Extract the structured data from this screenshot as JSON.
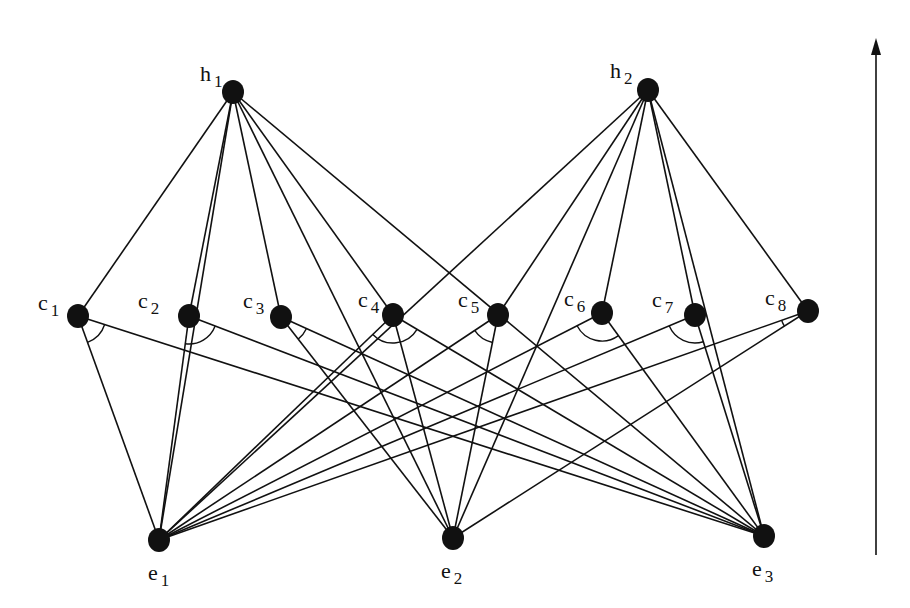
{
  "diagram": {
    "type": "layered-and-or-graph",
    "colors": {
      "ink": "#111111",
      "background": "#ffffff"
    },
    "nodes": [
      {
        "id": "h1",
        "base": "h",
        "sub": "1",
        "x": 233,
        "y": 92,
        "lx": 200,
        "ly": 63
      },
      {
        "id": "h2",
        "base": "h",
        "sub": "2",
        "x": 648,
        "y": 90,
        "lx": 610,
        "ly": 60
      },
      {
        "id": "c1",
        "base": "c",
        "sub": "1",
        "x": 78,
        "y": 316,
        "lx": 38,
        "ly": 292
      },
      {
        "id": "c2",
        "base": "c",
        "sub": "2",
        "x": 189,
        "y": 316,
        "lx": 138,
        "ly": 290
      },
      {
        "id": "c3",
        "base": "c",
        "sub": "3",
        "x": 281,
        "y": 317,
        "lx": 243,
        "ly": 290
      },
      {
        "id": "c4",
        "base": "c",
        "sub": "4",
        "x": 393,
        "y": 315,
        "lx": 358,
        "ly": 289
      },
      {
        "id": "c5",
        "base": "c",
        "sub": "5",
        "x": 498,
        "y": 315,
        "lx": 458,
        "ly": 289
      },
      {
        "id": "c6",
        "base": "c",
        "sub": "6",
        "x": 602,
        "y": 313,
        "lx": 564,
        "ly": 288
      },
      {
        "id": "c7",
        "base": "c",
        "sub": "7",
        "x": 695,
        "y": 315,
        "lx": 652,
        "ly": 289
      },
      {
        "id": "c8",
        "base": "c",
        "sub": "8",
        "x": 808,
        "y": 311,
        "lx": 765,
        "ly": 287
      },
      {
        "id": "e1",
        "base": "e",
        "sub": "1",
        "x": 159,
        "y": 540,
        "lx": 148,
        "ly": 562
      },
      {
        "id": "e2",
        "base": "e",
        "sub": "2",
        "x": 453,
        "y": 538,
        "lx": 441,
        "ly": 560
      },
      {
        "id": "e3",
        "base": "e",
        "sub": "3",
        "x": 764,
        "y": 536,
        "lx": 752,
        "ly": 558
      }
    ],
    "edges": [
      [
        "h1",
        "c1"
      ],
      [
        "h1",
        "c2"
      ],
      [
        "h1",
        "c3"
      ],
      [
        "h1",
        "c4"
      ],
      [
        "h1",
        "e1"
      ],
      [
        "h1",
        "e2"
      ],
      [
        "h1",
        "e3"
      ],
      [
        "h2",
        "c5"
      ],
      [
        "h2",
        "c6"
      ],
      [
        "h2",
        "c7"
      ],
      [
        "h2",
        "c8"
      ],
      [
        "h2",
        "e1"
      ],
      [
        "h2",
        "e2"
      ],
      [
        "h2",
        "e3"
      ],
      [
        "c1",
        "e1"
      ],
      [
        "c1",
        "e3"
      ],
      [
        "c2",
        "e1"
      ],
      [
        "c2",
        "e3"
      ],
      [
        "c3",
        "e2"
      ],
      [
        "c3",
        "e3"
      ],
      [
        "c4",
        "e1"
      ],
      [
        "c4",
        "e2"
      ],
      [
        "c4",
        "e3"
      ],
      [
        "c5",
        "e1"
      ],
      [
        "c5",
        "e2"
      ],
      [
        "c6",
        "e1"
      ],
      [
        "c6",
        "e3"
      ],
      [
        "c7",
        "e1"
      ],
      [
        "c7",
        "e3"
      ],
      [
        "c8",
        "e1"
      ],
      [
        "c8",
        "e2"
      ]
    ],
    "and_arcs": [
      "c1",
      "c2",
      "c3",
      "c4",
      "c5",
      "c6",
      "c7",
      "c8"
    ],
    "arrow": {
      "x": 876,
      "y1": 555,
      "y2": 38,
      "direction": "up"
    }
  }
}
